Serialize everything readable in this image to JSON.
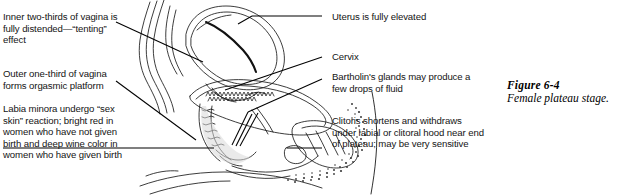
{
  "figure": {
    "domain": "textbook-anatomy-figure",
    "caption_number": "Figure 6-4",
    "caption_text": "Female plateau stage.",
    "illustration_alt": "Sagittal line drawing of female pelvic anatomy during the plateau stage of sexual response"
  },
  "annotations": {
    "left": [
      {
        "id": "inner-vagina",
        "text": "Inner two-thirds of vagina is fully distended—“tenting” effect"
      },
      {
        "id": "outer-vagina",
        "text": "Outer one-third of vagina forms orgasmic platform"
      },
      {
        "id": "labia-minora",
        "text": "Labia minora undergo “sex skin” reaction; bright red in women who have not given birth and deep wine color in women who have given birth"
      }
    ],
    "right": [
      {
        "id": "uterus",
        "text": "Uterus is fully elevated"
      },
      {
        "id": "cervix",
        "text": "Cervix"
      },
      {
        "id": "bartholin",
        "text": "Bartholin's glands may produce a few drops of fluid"
      },
      {
        "id": "clitoris",
        "text": "Clitoris shortens and withdraws under labial or clitoral hood near end of plateau; may be very sensitive"
      }
    ]
  },
  "colors": {
    "background": "#ffffff",
    "ink": "#141414",
    "line": "#000000",
    "stipple": "#3a3a3a"
  }
}
